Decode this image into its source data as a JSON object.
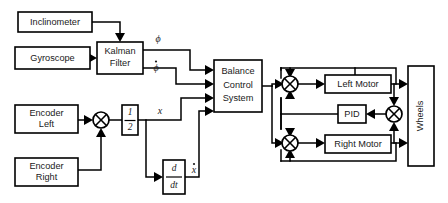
{
  "diagram": {
    "type": "block-diagram",
    "background_color": "#ffffff",
    "line_color": "#000000",
    "text_color": "#1a1a1a"
  },
  "blocks": {
    "inclinometer": {
      "label": "Inclinometer",
      "x": 18,
      "y": 12,
      "w": 74,
      "h": 20
    },
    "gyroscope": {
      "label": "Gyroscope",
      "x": 15,
      "y": 47,
      "w": 75,
      "h": 22
    },
    "kalman": {
      "label_line1": "Kalman",
      "label_line2": "Filter",
      "x": 97,
      "y": 42,
      "w": 46,
      "h": 32
    },
    "encoder_left": {
      "label_line1": "Encoder",
      "label_line2": "Left",
      "x": 15,
      "y": 105,
      "w": 63,
      "h": 28
    },
    "encoder_right": {
      "label_line1": "Encoder",
      "label_line2": "Right",
      "x": 15,
      "y": 158,
      "w": 63,
      "h": 28
    },
    "half_gain": {
      "numerator": "1",
      "denominator": "2",
      "x": 122,
      "y": 105,
      "w": 16,
      "h": 30
    },
    "derivative": {
      "numerator": "d",
      "denominator": "dt",
      "x": 163,
      "y": 160,
      "w": 22,
      "h": 34
    },
    "balance_control": {
      "label_line1": "Balance",
      "label_line2": "Control",
      "label_line3": "System",
      "x": 214,
      "y": 60,
      "w": 48,
      "h": 52
    },
    "left_motor": {
      "label": "Left Motor",
      "x": 325,
      "y": 75,
      "w": 66,
      "h": 18
    },
    "pid": {
      "label": "PID",
      "x": 338,
      "y": 105,
      "w": 28,
      "h": 18
    },
    "right_motor": {
      "label": "Right Motor",
      "x": 325,
      "y": 135,
      "w": 66,
      "h": 18
    },
    "wheels": {
      "label": "Wheels",
      "x": 408,
      "y": 66,
      "w": 26,
      "h": 100
    }
  },
  "summing_junctions": [
    {
      "name": "encoder-sum",
      "cx": 101,
      "cy": 120,
      "r": 8
    },
    {
      "name": "left-motor-sum",
      "cx": 290,
      "cy": 84,
      "r": 8
    },
    {
      "name": "right-motor-sum",
      "cx": 290,
      "cy": 143,
      "r": 8
    },
    {
      "name": "wheels-feedback-sum",
      "cx": 394,
      "cy": 114,
      "r": 8
    }
  ],
  "signal_labels": {
    "phi": {
      "text": "ϕ",
      "x": 158,
      "y": 40,
      "dot": false
    },
    "phi_dot": {
      "text": "ϕ",
      "x": 156,
      "y": 69,
      "dot": true
    },
    "x": {
      "text": "x",
      "x": 160,
      "y": 112,
      "dot": false
    },
    "x_dot": {
      "text": "x",
      "x": 194,
      "y": 171,
      "dot": true
    }
  },
  "connections": [
    {
      "name": "inclinometer-to-kalman",
      "from": "inclinometer",
      "to": "kalman"
    },
    {
      "name": "gyroscope-to-kalman",
      "from": "gyroscope",
      "to": "kalman"
    },
    {
      "name": "kalman-phi-to-balance",
      "from": "kalman",
      "to": "balance_control",
      "signal": "ϕ"
    },
    {
      "name": "kalman-phidot-to-balance",
      "from": "kalman",
      "to": "balance_control",
      "signal": "ϕ̇"
    },
    {
      "name": "encoder-left-to-sum",
      "from": "encoder_left",
      "to": "encoder-sum"
    },
    {
      "name": "encoder-right-to-sum",
      "from": "encoder_right",
      "to": "encoder-sum"
    },
    {
      "name": "sum-to-half-gain",
      "from": "encoder-sum",
      "to": "half_gain"
    },
    {
      "name": "half-gain-to-balance",
      "from": "half_gain",
      "to": "balance_control",
      "signal": "x"
    },
    {
      "name": "half-gain-to-derivative",
      "from": "half_gain",
      "to": "derivative"
    },
    {
      "name": "derivative-to-balance",
      "from": "derivative",
      "to": "balance_control",
      "signal": "ẋ"
    },
    {
      "name": "balance-to-left-sum",
      "from": "balance_control",
      "to": "left-motor-sum"
    },
    {
      "name": "balance-to-right-sum",
      "from": "balance_control",
      "to": "right-motor-sum"
    },
    {
      "name": "left-sum-to-left-motor",
      "from": "left-motor-sum",
      "to": "left_motor"
    },
    {
      "name": "right-sum-to-right-motor",
      "from": "right-motor-sum",
      "to": "right_motor"
    },
    {
      "name": "left-motor-to-wheels",
      "from": "left_motor",
      "to": "wheels"
    },
    {
      "name": "right-motor-to-wheels",
      "from": "right_motor",
      "to": "wheels"
    },
    {
      "name": "left-motor-feedback",
      "from": "left_motor",
      "to": "left-motor-sum"
    },
    {
      "name": "right-motor-feedback",
      "from": "right_motor",
      "to": "right-motor-sum"
    },
    {
      "name": "left-motor-to-wheels-sum",
      "from": "left_motor",
      "to": "wheels-feedback-sum"
    },
    {
      "name": "right-motor-to-wheels-sum",
      "from": "right_motor",
      "to": "wheels-feedback-sum"
    },
    {
      "name": "wheels-sum-to-pid",
      "from": "wheels-feedback-sum",
      "to": "pid"
    },
    {
      "name": "pid-to-left-sum",
      "from": "pid",
      "to": "left-motor-sum"
    },
    {
      "name": "pid-to-right-sum",
      "from": "pid",
      "to": "right-motor-sum"
    }
  ]
}
